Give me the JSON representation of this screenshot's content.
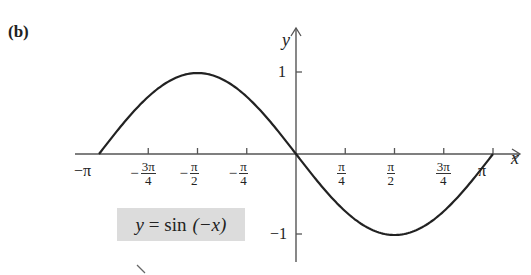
{
  "panel_label": "(b)",
  "equation": {
    "lhs": "y",
    "eq": " = ",
    "fn": "sin",
    "arg": "(−x)"
  },
  "axes": {
    "x_label": "x",
    "y_label": "y"
  },
  "x_ticks": [
    {
      "label": "−π",
      "neg": "",
      "num": "",
      "den": "",
      "value": -3.14159
    },
    {
      "label": "−3π/4",
      "neg": "−",
      "num": "3π",
      "den": "4",
      "value": -2.35619
    },
    {
      "label": "−π/2",
      "neg": "−",
      "num": "π",
      "den": "2",
      "value": -1.5708
    },
    {
      "label": "−π/4",
      "neg": "−",
      "num": "π",
      "den": "4",
      "value": -0.7854
    },
    {
      "label": "π/4",
      "neg": "",
      "num": "π",
      "den": "4",
      "value": 0.7854
    },
    {
      "label": "π/2",
      "neg": "",
      "num": "π",
      "den": "2",
      "value": 1.5708
    },
    {
      "label": "3π/4",
      "neg": "",
      "num": "3π",
      "den": "4",
      "value": 2.35619
    },
    {
      "label": "π",
      "neg": "",
      "num": "",
      "den": "",
      "value": 3.14159
    }
  ],
  "y_ticks": [
    {
      "label": "1",
      "value": 1
    },
    {
      "label": "−1",
      "value": -1
    }
  ],
  "chart_data": {
    "type": "line",
    "title": "(b)",
    "xlabel": "x",
    "ylabel": "y",
    "annotation": "y = sin (−x)",
    "xlim": [
      -3.14159,
      3.14159
    ],
    "ylim": [
      -1,
      1
    ],
    "grid": false,
    "legend": null,
    "x_tick_labels": [
      "−π",
      "−3π/4",
      "−π/2",
      "−π/4",
      "π/4",
      "π/2",
      "3π/4",
      "π"
    ],
    "y_tick_labels": [
      "1",
      "−1"
    ],
    "series": [
      {
        "name": "y = sin(−x)",
        "x": [
          -3.14159,
          -2.35619,
          -1.5708,
          -0.7854,
          0,
          0.7854,
          1.5708,
          2.35619,
          3.14159
        ],
        "values": [
          0,
          0.7071,
          1,
          0.7071,
          0,
          -0.7071,
          -1,
          -0.7071,
          0
        ]
      }
    ],
    "colors": {
      "curve": "#222222",
      "axes": "#555555",
      "annotation_bg": "#dcdcdc"
    }
  }
}
